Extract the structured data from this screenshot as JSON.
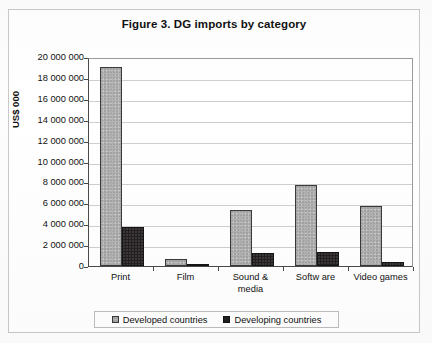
{
  "chart_data": {
    "type": "bar",
    "title": "Figure 3. DG imports by category",
    "xlabel": "",
    "ylabel": "US$ 000",
    "ylim": [
      0,
      20000000
    ],
    "ytick_step": 2000000,
    "grid": true,
    "legend_position": "bottom",
    "categories": [
      "Print",
      "Film",
      "Sound & media",
      "Softw are",
      "Video games"
    ],
    "category_lines": [
      [
        "Print"
      ],
      [
        "Film"
      ],
      [
        "Sound &",
        "media"
      ],
      [
        "Softw are"
      ],
      [
        "Video games"
      ]
    ],
    "ytick_labels": [
      "20 000 000",
      "18 000 000",
      "16 000 000",
      "14 000 000",
      "12 000 000",
      "10 000 000",
      "8 000 000",
      "6 000 000",
      "4 000 000",
      "2 000 000",
      "0"
    ],
    "ytick_values": [
      20000000,
      18000000,
      16000000,
      14000000,
      12000000,
      10000000,
      8000000,
      6000000,
      4000000,
      2000000,
      0
    ],
    "series": [
      {
        "name": "Developed countries",
        "color": "#b3b3b3",
        "values": [
          19000000,
          700000,
          5400000,
          7800000,
          5700000
        ]
      },
      {
        "name": "Developing countries",
        "color": "#231f20",
        "values": [
          3700000,
          200000,
          1200000,
          1300000,
          400000
        ]
      }
    ]
  },
  "legend": {
    "entries": [
      {
        "label": "Developed countries",
        "swatch": "developed"
      },
      {
        "label": "Developing countries",
        "swatch": "developing"
      }
    ]
  }
}
